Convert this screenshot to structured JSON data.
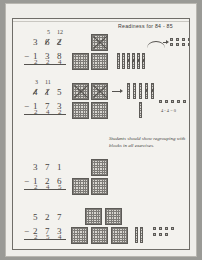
{
  "page": {
    "header": "Readiness for 84 - 85",
    "teacher_note": "Students should show regrouping with blocks in all exercises.",
    "inline_note": "4 - 4 = 0",
    "ink_color": "#44423e",
    "paper_color": "#f3f2ee"
  },
  "problems": [
    {
      "id": 1,
      "minuend": [
        "3",
        "6",
        "2"
      ],
      "regroup_marks": [
        "",
        "5",
        "12"
      ],
      "crossed": [
        false,
        true,
        true
      ],
      "operator": "−",
      "subtrahend": [
        "1",
        "3",
        "8"
      ],
      "answer": [
        "2",
        "2",
        "4"
      ],
      "blocks": {
        "flats_total": 3,
        "flats_crossed": 1,
        "rods_total": 6,
        "rods_crossed": 4,
        "units_total": 5,
        "units_crossed": 0
      }
    },
    {
      "id": 2,
      "minuend": [
        "4",
        "1",
        "5"
      ],
      "regroup_marks": [
        "3",
        "11",
        ""
      ],
      "crossed": [
        true,
        true,
        false
      ],
      "operator": "−",
      "subtrahend": [
        "1",
        "7",
        "3"
      ],
      "answer": [
        "2",
        "4",
        "2"
      ],
      "blocks": {
        "flats_total": 4,
        "flats_crossed": 2,
        "rods_total": 5,
        "rods_crossed": 2,
        "units_total": 5,
        "units_crossed": 0
      }
    },
    {
      "id": 3,
      "minuend": [
        "3",
        "7",
        "1"
      ],
      "regroup_marks": [
        "",
        "",
        ""
      ],
      "crossed": [
        false,
        false,
        false
      ],
      "operator": "−",
      "subtrahend": [
        "1",
        "2",
        "6"
      ],
      "answer": [
        "2",
        "4",
        "5"
      ],
      "blocks": {
        "flats_total": 3,
        "flats_crossed": 0,
        "rods_total": 0,
        "rods_crossed": 0,
        "units_total": 0,
        "units_crossed": 0
      }
    },
    {
      "id": 4,
      "minuend": [
        "5",
        "2",
        "7"
      ],
      "regroup_marks": [
        "",
        "",
        ""
      ],
      "crossed": [
        false,
        false,
        false
      ],
      "operator": "−",
      "subtrahend": [
        "2",
        "7",
        "3"
      ],
      "answer": [
        "2",
        "5",
        "4"
      ],
      "blocks": {
        "flats_total": 5,
        "flats_crossed": 0,
        "rods_total": 2,
        "rods_crossed": 0,
        "units_total": 7,
        "units_crossed": 0
      }
    }
  ]
}
